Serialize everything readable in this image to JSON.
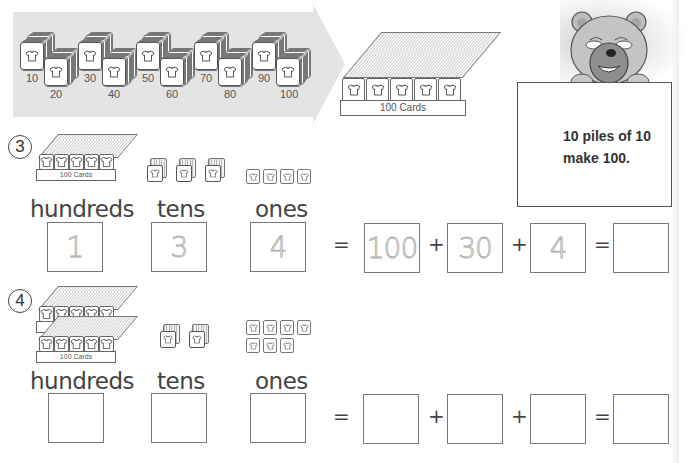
{
  "intro": {
    "stack_labels": [
      "10",
      "20",
      "30",
      "40",
      "50",
      "60",
      "70",
      "80",
      "90",
      "100"
    ],
    "tray_label": "100 Cards"
  },
  "bear_sign": {
    "line1": "10 piles of 10",
    "line2": "make 100."
  },
  "problems": [
    {
      "number": "3",
      "tray_label": "100 Cards",
      "hundreds_count": 1,
      "tens_count": 3,
      "ones_count": 4,
      "labels": {
        "hundreds": "hundreds",
        "tens": "tens",
        "ones": "ones"
      },
      "answers": {
        "hundreds": "1",
        "tens": "3",
        "ones": "4"
      },
      "expansion": {
        "hundreds": "100",
        "tens": "30",
        "ones": "4",
        "total": ""
      },
      "ops": {
        "eq1": "=",
        "plus1": "+",
        "plus2": "+",
        "eq2": "="
      }
    },
    {
      "number": "4",
      "tray_label": "100 Cards",
      "hundreds_count": 2,
      "tens_count": 2,
      "ones_count": 7,
      "labels": {
        "hundreds": "hundreds",
        "tens": "tens",
        "ones": "ones"
      },
      "answers": {
        "hundreds": "",
        "tens": "",
        "ones": ""
      },
      "expansion": {
        "hundreds": "",
        "tens": "",
        "ones": "",
        "total": ""
      },
      "ops": {
        "eq1": "=",
        "plus1": "+",
        "plus2": "+",
        "eq2": "="
      }
    }
  ]
}
